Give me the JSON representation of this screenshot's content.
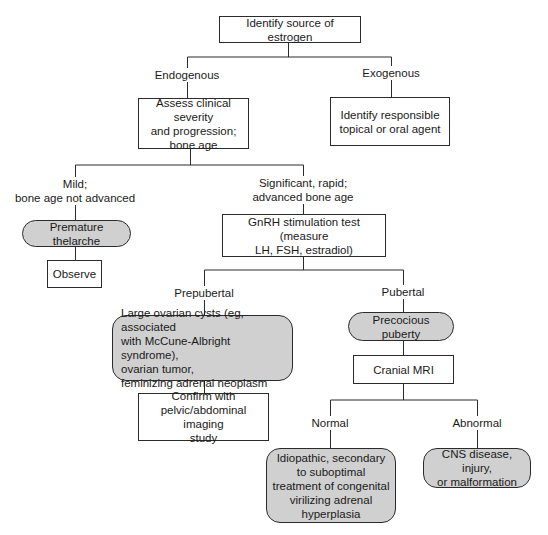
{
  "diagram": {
    "type": "flowchart",
    "colors": {
      "line": "#2b2b2b",
      "shaded_fill": "#d0d0d0",
      "box_fill": "#ffffff"
    },
    "nodes": {
      "root": "Identify source of estrogen",
      "assess": "Assess clinical severity\nand progression;\nbone age",
      "identify_agent": "Identify responsible\ntopical or oral agent",
      "premature_thelarche": "Premature thelarche",
      "observe": "Observe",
      "gnrh_test": "GnRH stimulation test (measure\nLH, FSH, estradiol)",
      "ovarian": "Large ovarian cysts (eg, associated\n   with McCune-Albright syndrome),\novarian tumor,\nfeminizing adrenal neoplasm",
      "confirm": "Confirm with\npelvic/abdominal imaging\nstudy",
      "precocious_puberty": "Precocious puberty",
      "cranial_mri": "Cranial MRI",
      "idiopathic": "Idiopathic, secondary\nto suboptimal\ntreatment of congenital\nvirilizing adrenal\nhyperplasia",
      "cns": "CNS disease, injury,\nor malformation"
    },
    "edge_labels": {
      "endogenous": "Endogenous",
      "exogenous": "Exogenous",
      "mild": "Mild;\nbone age not advanced",
      "significant": "Significant, rapid;\nadvanced bone age",
      "prepubertal": "Prepubertal",
      "pubertal": "Pubertal",
      "normal": "Normal",
      "abnormal": "Abnormal"
    }
  }
}
